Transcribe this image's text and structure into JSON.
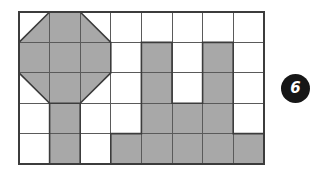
{
  "figure": {
    "type": "shaded-grid-puzzle",
    "badge": {
      "label": "6",
      "shape": "circle",
      "background_color": "#161616",
      "text_color": "#ffffff"
    },
    "grid": {
      "columns": 8,
      "rows": 5,
      "cell_width": 30.6,
      "cell_height": 30.4,
      "origin_x": 19,
      "origin_y": 12,
      "line_color": "#4a4a4a",
      "outer_line_color": "#3c3c3c",
      "fill_color": "#a8a8a8",
      "empty_color": "#ffffff"
    },
    "shapes": [
      {
        "name": "octagon",
        "description": "Large shaded octagon occupying the top-left 3x3 block of cells",
        "col_start": 1,
        "col_end": 3,
        "row_start": 1,
        "row_end": 3,
        "fill": "#a8a8a8"
      },
      {
        "name": "stem",
        "description": "Vertical shaded bar in column 2 spanning rows 4 and 5",
        "column": 2,
        "row_start": 4,
        "row_end": 5,
        "fill": "#a8a8a8"
      },
      {
        "name": "u-shape",
        "description": "Shaded U-shaped figure on the right half of the grid",
        "fill": "#a8a8a8"
      }
    ],
    "shaded_cells": [
      {
        "row": 2,
        "col": 5
      },
      {
        "row": 2,
        "col": 7
      },
      {
        "row": 3,
        "col": 5
      },
      {
        "row": 3,
        "col": 7
      },
      {
        "row": 4,
        "col": 5
      },
      {
        "row": 4,
        "col": 6
      },
      {
        "row": 4,
        "col": 7
      },
      {
        "row": 5,
        "col": 4
      },
      {
        "row": 5,
        "col": 5
      },
      {
        "row": 5,
        "col": 6
      },
      {
        "row": 5,
        "col": 7
      },
      {
        "row": 5,
        "col": 8
      }
    ],
    "cell_matrix": [
      [
        "octagon-corner",
        "octagon",
        "octagon-corner",
        "empty",
        "empty",
        "empty",
        "empty",
        "empty"
      ],
      [
        "octagon",
        "octagon",
        "octagon",
        "empty",
        "filled",
        "empty",
        "filled",
        "empty"
      ],
      [
        "octagon-corner",
        "octagon",
        "octagon-corner",
        "empty",
        "filled",
        "empty",
        "filled",
        "empty"
      ],
      [
        "empty",
        "filled",
        "empty",
        "empty",
        "filled",
        "filled",
        "filled",
        "empty"
      ],
      [
        "empty",
        "filled",
        "empty",
        "filled",
        "filled",
        "filled",
        "filled",
        "filled"
      ]
    ]
  }
}
